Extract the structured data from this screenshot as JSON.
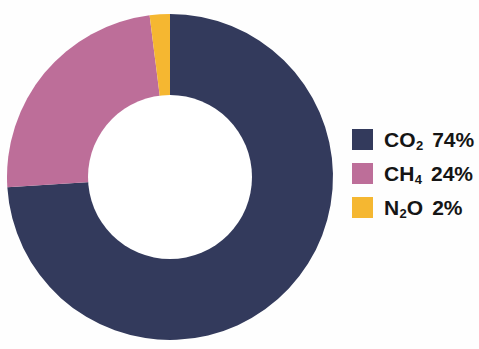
{
  "chart_data": {
    "type": "pie",
    "variant": "donut",
    "title": "",
    "subtitle": "",
    "xlabel": "",
    "ylabel": "",
    "grid": false,
    "legend_position": "right",
    "hole_ratio": 0.5,
    "start_angle_deg": 0,
    "direction": "clockwise",
    "unit": "%",
    "categories": [
      "CO2",
      "CH4",
      "N2O"
    ],
    "values": [
      74,
      24,
      2
    ],
    "colors": [
      "#333a5c",
      "#bd6e99",
      "#f5b731"
    ],
    "slices": [
      {
        "name": "CO2",
        "symbol_prefix": "CO",
        "symbol_sub": "2",
        "symbol_suffix": "",
        "value": 74,
        "value_label": "74%",
        "color": "#333a5c",
        "start_deg": 0,
        "end_deg": 266.4
      },
      {
        "name": "CH4",
        "symbol_prefix": "CH",
        "symbol_sub": "4",
        "symbol_suffix": "",
        "value": 24,
        "value_label": "24%",
        "color": "#bd6e99",
        "start_deg": 266.4,
        "end_deg": 352.8
      },
      {
        "name": "N2O",
        "symbol_prefix": "N",
        "symbol_sub": "2",
        "symbol_suffix": "O",
        "value": 2,
        "value_label": "2%",
        "color": "#f5b731",
        "start_deg": 352.8,
        "end_deg": 360
      }
    ]
  },
  "legend": {
    "rows": [
      {
        "prefix": "CO",
        "sub": "2",
        "suffix": "",
        "value_label": "74%",
        "color": "#333a5c"
      },
      {
        "prefix": "CH",
        "sub": "4",
        "suffix": "",
        "value_label": "24%",
        "color": "#bd6e99"
      },
      {
        "prefix": "N",
        "sub": "2",
        "suffix": "O",
        "value_label": "2%",
        "color": "#f5b731"
      }
    ]
  },
  "canvas": {
    "background": "#fefefe",
    "center_x": 170,
    "center_y": 177,
    "outer_radius": 163,
    "inner_radius": 82
  }
}
